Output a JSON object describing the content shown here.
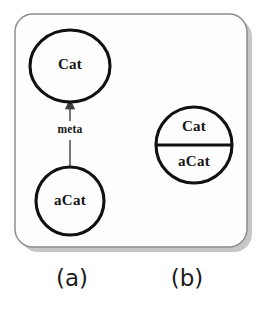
{
  "figure": {
    "panel_border_color": "#8d8d8d",
    "shape_stroke_color": "#111111",
    "background_color": "#ffffff",
    "panels": [
      {
        "id": "a",
        "caption": "(a)",
        "nodes": [
          {
            "id": "cat-ellipse",
            "label": "Cat",
            "shape": "ellipse"
          },
          {
            "id": "acat-circle",
            "label": "aCat",
            "shape": "circle"
          }
        ],
        "edges": [
          {
            "id": "meta-edge",
            "label": "meta",
            "from": "aCat",
            "to": "Cat",
            "arrow": "up"
          }
        ]
      },
      {
        "id": "b",
        "caption": "(b)",
        "nodes": [
          {
            "id": "split-circle",
            "shape": "divided-circle",
            "top_label": "Cat",
            "bottom_label": "aCat"
          }
        ],
        "edges": []
      }
    ]
  }
}
